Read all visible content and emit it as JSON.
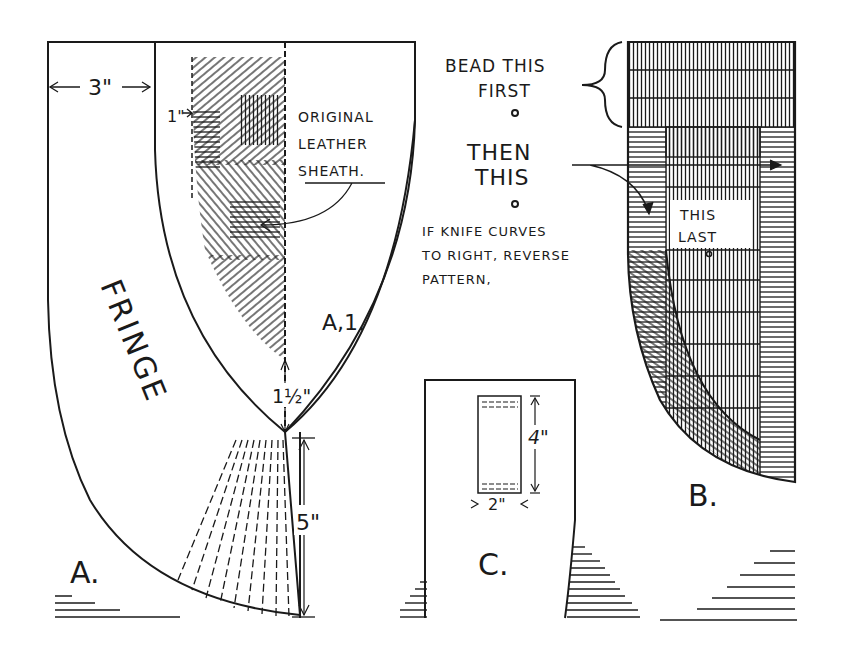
{
  "figure_a": {
    "label": "A.",
    "fringe_label": "FRINGE",
    "width_dim": "3\"",
    "inset_dim": "1\"",
    "tip_dim": "1½\"",
    "fringe_len_dim": "5\"",
    "sheath_callout": [
      "ORIGINAL",
      "LEATHER",
      "SHEATH."
    ],
    "inner_label": "A,1."
  },
  "figure_b": {
    "label": "B.",
    "step1": [
      "BEAD THIS",
      "FIRST"
    ],
    "step2": [
      "THEN",
      "THIS"
    ],
    "step3": [
      "THIS",
      "LAST"
    ],
    "note": [
      "IF KNIFE CURVES",
      "TO RIGHT, REVERSE",
      "PATTERN,"
    ]
  },
  "figure_c": {
    "label": "C.",
    "height_dim": "4\"",
    "width_dim": "2\""
  },
  "colors": {
    "ink": "#1a1a1a",
    "paper": "#ffffff"
  }
}
